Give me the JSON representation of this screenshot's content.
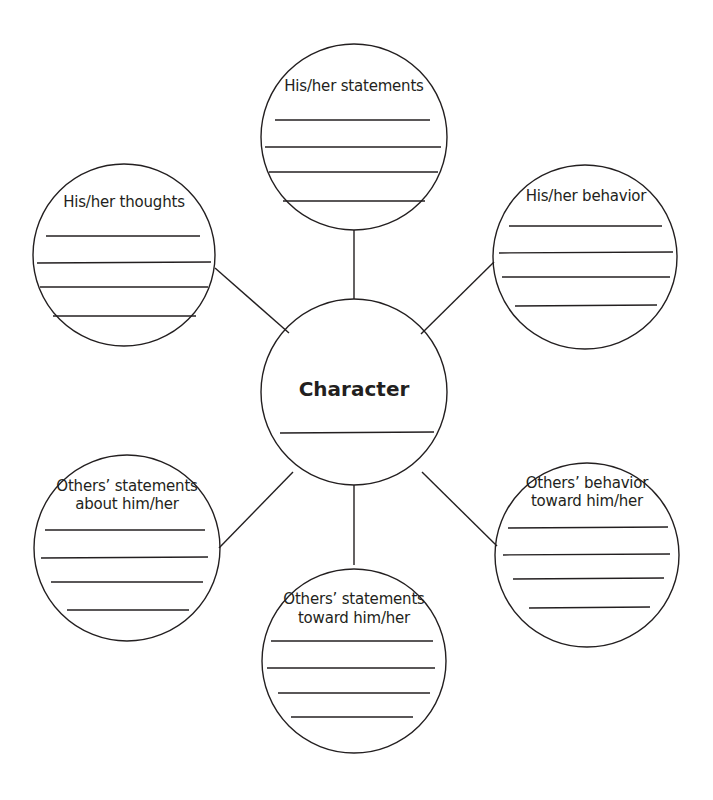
{
  "diagram": {
    "type": "character-web",
    "center": {
      "title": "Character",
      "blank_lines": 1
    },
    "nodes": [
      {
        "id": "top",
        "label": "His/her statements",
        "blank_lines": 4
      },
      {
        "id": "upper-left",
        "label": "His/her thoughts",
        "blank_lines": 4
      },
      {
        "id": "upper-right",
        "label": "His/her behavior",
        "blank_lines": 4
      },
      {
        "id": "lower-left",
        "label_line1": "Others’ statements",
        "label_line2": "about him/her",
        "blank_lines": 4
      },
      {
        "id": "lower-right",
        "label_line1": "Others’ behavior",
        "label_line2": "toward him/her",
        "blank_lines": 4
      },
      {
        "id": "bottom",
        "label_line1": "Others’ statements",
        "label_line2": "toward him/her",
        "blank_lines": 4
      }
    ],
    "colors": {
      "stroke": "#231f20",
      "background": "#ffffff"
    }
  }
}
